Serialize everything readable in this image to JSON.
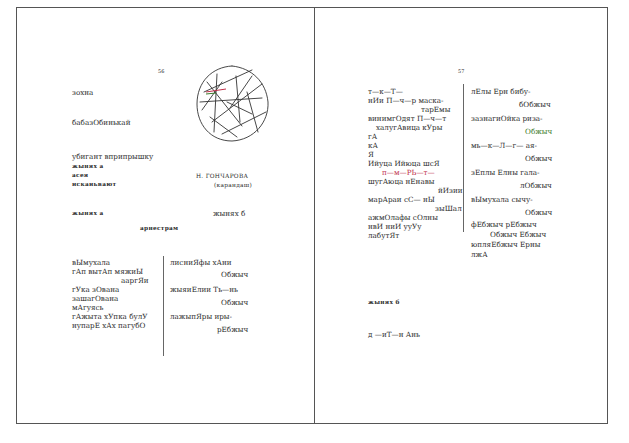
{
  "left_page": {
    "page_number": "56",
    "heading1": "зохна",
    "heading2": "бабазОбинькай",
    "block": [
      "убигант вприпрышку",
      "жынях а",
      "асея",
      "искаиьвают"
    ],
    "caption_name": "Н. ГОНЧАРОВА",
    "caption_medium": "(карандаш)",
    "label_a": "жынях а",
    "label_b": "жынях б",
    "subtitle": "арнестрам",
    "col_left": [
      "вЫмухала",
      "гАп  вытАп  мяжиЫ",
      "ааргЯи",
      "гУка  зОвана",
      "зашагОвана",
      "мАгуясь",
      "гАжыта  хУпка  булУ",
      "нупарЕ  хАх  пагубО"
    ],
    "col_right": [
      "лисниЯфы  хАни",
      "Обжыч",
      "жыяиЕлии  Ть—нь",
      "Обжыч",
      "лажыпЯры  иры-",
      "рЕбжыч"
    ]
  },
  "right_page": {
    "page_number": "57",
    "col_left": [
      "т—к—Т—",
      "нИи  П—ч—р  маска-",
      "тарЕмы",
      "винимгОдят  П—ч—т",
      "халугАвица  кУры",
      "гА",
      "кА",
      "Я",
      "Ийуца  Ийюца  шсЯ",
      "п—м—РЬ—т—",
      "шугАюца  нЕнавы",
      "йИзии",
      "марАраи  сС—  нЫ",
      "зыШал",
      "ажмОлафы  сОлны",
      "нвИ  ниИ  ууУу",
      "лабутЯт"
    ],
    "col_right": [
      "лЕлы  Ерн  бибу-",
      "бОбжыч",
      "зазнагиОйка  риза-",
      "Обжыч",
      "мь—к—Л—г—  ая-",
      "Обжыч",
      "зЕплы  Елны  гала-",
      "лОбжыч",
      "вЫмухала  сычу-",
      "Обжыч",
      "фЕбжыч  рЕбжыч",
      "Обжыч  Ебжыч",
      "юпляЕбжыч  Ерны",
      "лжА"
    ],
    "label_b": "жынях б",
    "last_line": "д —иТ—н  Ань"
  },
  "colors": {
    "red_ink": "#c0304a",
    "green_ink": "#3a7a2a",
    "border": "#555555"
  }
}
